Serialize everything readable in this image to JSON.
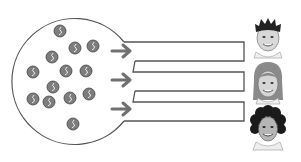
{
  "diagram": {
    "pool": {
      "label": "",
      "shape": "circle",
      "stroke_color": "#4a4a4a",
      "token_count": 13,
      "token_color": "#7a7a7a",
      "tokens": [
        {
          "x": 60,
          "y": 31
        },
        {
          "x": 75,
          "y": 48
        },
        {
          "x": 93,
          "y": 46
        },
        {
          "x": 52,
          "y": 57
        },
        {
          "x": 33,
          "y": 72
        },
        {
          "x": 66,
          "y": 71
        },
        {
          "x": 86,
          "y": 71
        },
        {
          "x": 53,
          "y": 87
        },
        {
          "x": 33,
          "y": 99
        },
        {
          "x": 49,
          "y": 102
        },
        {
          "x": 70,
          "y": 98
        },
        {
          "x": 89,
          "y": 94
        },
        {
          "x": 73,
          "y": 124
        }
      ]
    },
    "arrows": [
      {
        "name": "arrow-1",
        "y": 51
      },
      {
        "name": "arrow-2",
        "y": 80
      },
      {
        "name": "arrow-3",
        "y": 109
      }
    ],
    "channels": [
      {
        "name": "channel-1",
        "top": 42,
        "bottom": 61
      },
      {
        "name": "channel-2",
        "top": 72,
        "bottom": 91
      },
      {
        "name": "channel-3",
        "top": 102,
        "bottom": 121
      }
    ],
    "people": [
      {
        "name": "person-boy",
        "hair": "short-dark"
      },
      {
        "name": "person-girl",
        "hair": "long-light"
      },
      {
        "name": "person-girl-curly",
        "hair": "curly-dark"
      }
    ],
    "colors": {
      "line": "#555555",
      "arrow": "#707070",
      "token": "#7d7d7d",
      "background": "#ffffff"
    }
  }
}
